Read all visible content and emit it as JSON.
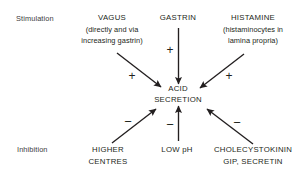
{
  "diagram": {
    "background_color": "#ffffff",
    "ink_color": "#231f20",
    "side_labels": {
      "stimulation": "Stimulation",
      "inhibition": "Inhibition"
    },
    "center": {
      "line1": "ACID",
      "line2": "SECRETION"
    },
    "stimulators": [
      {
        "id": "vagus",
        "title": "VAGUS",
        "sub1": "(directly and via",
        "sub2": "increasing gastrin)",
        "sign": "+"
      },
      {
        "id": "gastrin",
        "title": "GASTRIN",
        "sub1": "",
        "sub2": "",
        "sign": "+"
      },
      {
        "id": "histamine",
        "title": "HISTAMINE",
        "sub1": "(histaminocytes in",
        "sub2": "lamina propria)",
        "sign": "+"
      }
    ],
    "inhibitors": [
      {
        "id": "higher-centres",
        "title": "HIGHER",
        "sub1": "CENTRES",
        "sub2": "",
        "sign": "−"
      },
      {
        "id": "low-ph",
        "title": "LOW pH",
        "sub1": "",
        "sub2": "",
        "sign": "−"
      },
      {
        "id": "cholecystokinin",
        "title": "CHOLECYSTOKININ",
        "sub1": "GIP, SECRETIN",
        "sub2": "",
        "sign": "−"
      }
    ]
  }
}
